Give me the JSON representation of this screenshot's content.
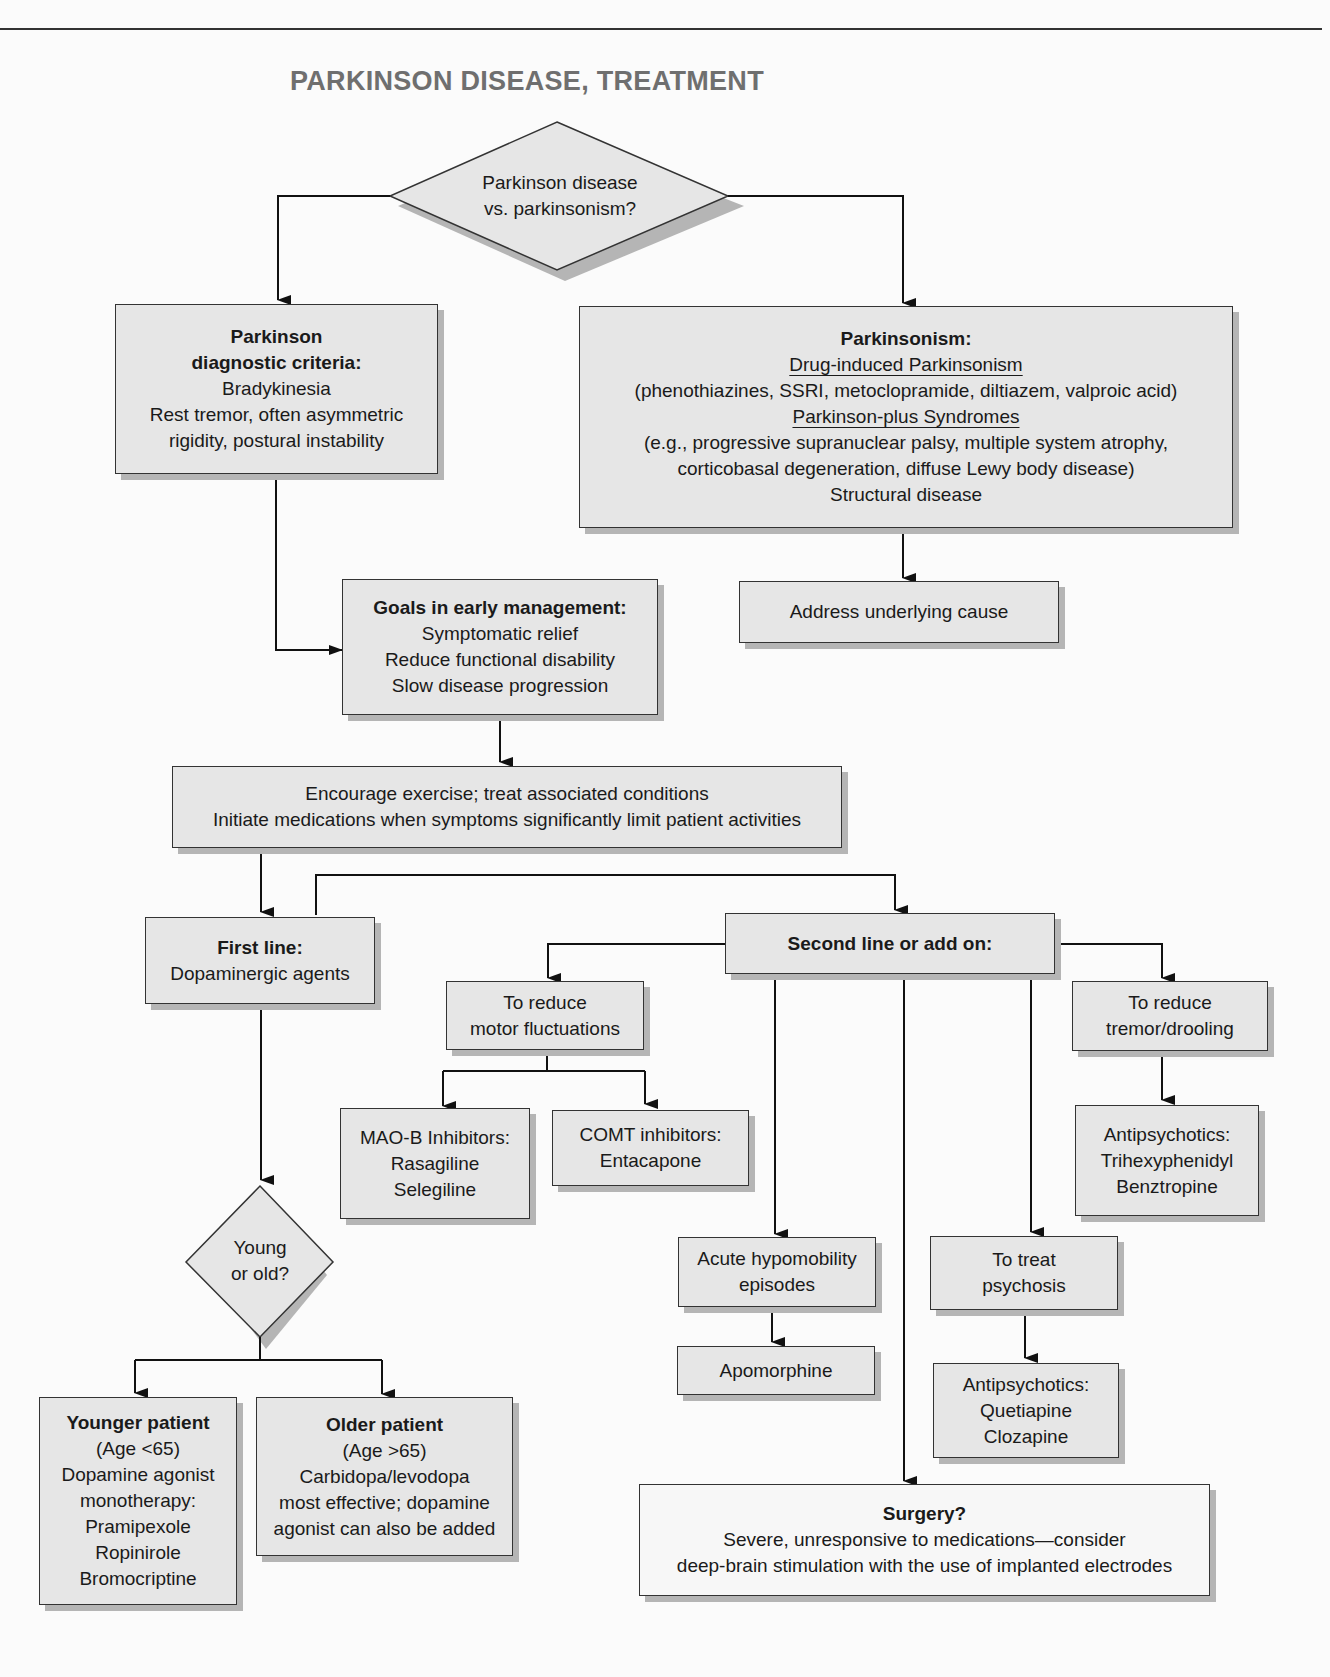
{
  "title": "PARKINSON DISEASE, TREATMENT",
  "colors": {
    "box_fill": "#e6e6e6",
    "box_border": "#333333",
    "shadow": "#b5b5b5",
    "title": "#6f6f6f",
    "background": "#fbfbfb"
  },
  "nodes": {
    "start": {
      "lines": [
        "Parkinson disease",
        "vs. parkinsonism?"
      ]
    },
    "diagnostic": {
      "heading": [
        "Parkinson",
        "diagnostic criteria:"
      ],
      "lines": [
        "Bradykinesia",
        "Rest tremor, often asymmetric",
        "rigidity, postural instability"
      ]
    },
    "parkinsonism": {
      "heading": "Parkinsonism:",
      "sub1": "Drug-induced Parkinsonism",
      "sub1_detail": "(phenothiazines, SSRI, metoclopramide, diltiazem, valproic acid)",
      "sub2": "Parkinson-plus Syndromes",
      "sub2_detail": [
        "(e.g., progressive supranuclear palsy, multiple system atrophy,",
        "corticobasal degeneration, diffuse Lewy body disease)"
      ],
      "sub3": "Structural disease"
    },
    "address": {
      "text": "Address underlying cause"
    },
    "goals": {
      "heading": "Goals in early management:",
      "lines": [
        "Symptomatic relief",
        "Reduce functional disability",
        "Slow disease progression"
      ]
    },
    "encourage": {
      "lines": [
        "Encourage exercise; treat associated conditions",
        "Initiate medications when symptoms significantly limit patient activities"
      ]
    },
    "first_line": {
      "heading": "First line:",
      "text": "Dopaminergic agents"
    },
    "second_line": {
      "heading": "Second line or add on:"
    },
    "motor": {
      "lines": [
        "To reduce",
        "motor fluctuations"
      ]
    },
    "maob": {
      "lines": [
        "MAO-B Inhibitors:",
        "Rasagiline",
        "Selegiline"
      ]
    },
    "comt": {
      "lines": [
        "COMT inhibitors:",
        "Entacapone"
      ]
    },
    "tremor": {
      "lines": [
        "To reduce",
        "tremor/drooling"
      ]
    },
    "anticholinergic": {
      "lines": [
        "Antipsychotics:",
        "Trihexyphenidyl",
        "Benztropine"
      ]
    },
    "young_old": {
      "lines": [
        "Young",
        "or old?"
      ]
    },
    "hypomobility": {
      "lines": [
        "Acute hypomobility",
        "episodes"
      ]
    },
    "apomorphine": {
      "text": "Apomorphine"
    },
    "psychosis": {
      "lines": [
        "To treat",
        "psychosis"
      ]
    },
    "antipsychotics": {
      "lines": [
        "Antipsychotics:",
        "Quetiapine",
        "Clozapine"
      ]
    },
    "younger": {
      "heading": "Younger patient",
      "lines": [
        "(Age <65)",
        "Dopamine agonist",
        "monotherapy:",
        "Pramipexole",
        "Ropinirole",
        "Bromocriptine"
      ]
    },
    "older": {
      "heading": "Older patient",
      "lines": [
        "(Age >65)",
        "Carbidopa/levodopa",
        "most effective; dopamine",
        "agonist can also be added"
      ]
    },
    "surgery": {
      "heading": "Surgery?",
      "lines": [
        "Severe, unresponsive to medications—consider",
        "deep-brain stimulation with the use of implanted electrodes"
      ]
    }
  }
}
